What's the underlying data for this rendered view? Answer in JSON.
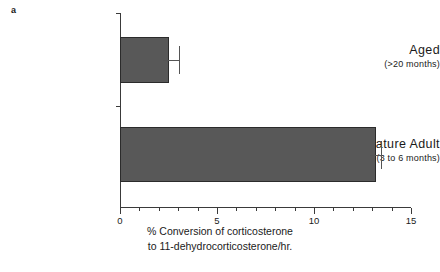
{
  "panel": {
    "label": "a"
  },
  "chart_data": {
    "type": "bar",
    "orientation": "horizontal",
    "title": "",
    "subtitle": "",
    "xlabel_line1": "% Conversion of corticosterone",
    "xlabel_line2": "to  11-dehydrocorticosterone/hr.",
    "ylabel": "",
    "categories": [
      "Aged",
      "Mature Adult"
    ],
    "category_sublabels": [
      "(>20  months)",
      "(3 to 6  months)"
    ],
    "values": [
      2.5,
      13.2
    ],
    "errors": [
      0.55,
      0.25
    ],
    "xlim": [
      0,
      15
    ],
    "xticks": [
      0,
      5,
      10,
      15
    ],
    "xticklabels": [
      "0",
      "5",
      "10",
      "15"
    ],
    "xminor_step": 1,
    "grid": false,
    "legend": null,
    "bar_color": "#585858",
    "bar_edge_color": "#2b2b2b",
    "axis_color": "#3a3a3a",
    "error_color": "#555555"
  }
}
